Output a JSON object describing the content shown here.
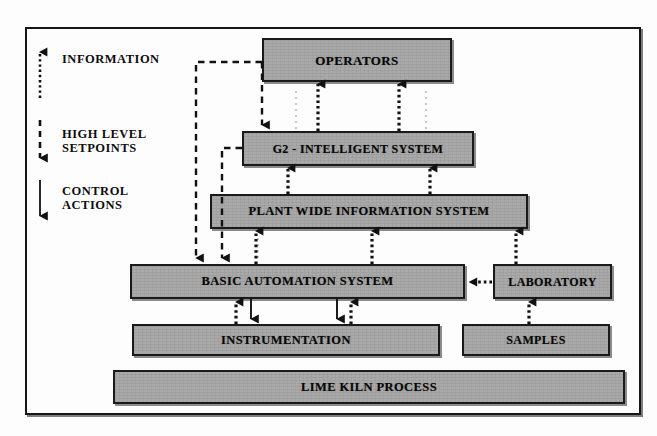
{
  "diagram": {
    "colors": {
      "box_fill": "#a9a9a9",
      "box_border": "#1a1a1a",
      "line": "#111111",
      "background": "#fdfdfd"
    },
    "legend": {
      "items": [
        {
          "label": "INFORMATION",
          "line_style": "dotted",
          "direction": "up"
        },
        {
          "label": "HIGH LEVEL\nSETPOINTS",
          "line_style": "dashed",
          "direction": "down"
        },
        {
          "label": "CONTROL\nACTIONS",
          "line_style": "solid",
          "direction": "down"
        }
      ]
    },
    "nodes": [
      {
        "id": "operators",
        "label": "OPERATORS",
        "x": 262,
        "y": 38,
        "w": 190,
        "h": 44,
        "font_size": 13
      },
      {
        "id": "g2",
        "label": "G2 - INTELLIGENT SYSTEM",
        "x": 242,
        "y": 131,
        "w": 232,
        "h": 35,
        "font_size": 12
      },
      {
        "id": "pwis",
        "label": "PLANT WIDE INFORMATION SYSTEM",
        "x": 210,
        "y": 194,
        "w": 318,
        "h": 35,
        "font_size": 12.5
      },
      {
        "id": "bas",
        "label": "BASIC AUTOMATION SYSTEM",
        "x": 130,
        "y": 264,
        "w": 335,
        "h": 35,
        "font_size": 12.5
      },
      {
        "id": "laboratory",
        "label": "LABORATORY",
        "x": 493,
        "y": 264,
        "w": 119,
        "h": 35,
        "font_size": 12
      },
      {
        "id": "instrumentation",
        "label": "INSTRUMENTATION",
        "x": 132,
        "y": 324,
        "w": 308,
        "h": 32,
        "font_size": 12.5
      },
      {
        "id": "samples",
        "label": "SAMPLES",
        "x": 462,
        "y": 324,
        "w": 148,
        "h": 32,
        "font_size": 12
      },
      {
        "id": "limekiln",
        "label": "LIME KILN PROCESS",
        "x": 113,
        "y": 370,
        "w": 512,
        "h": 34,
        "font_size": 12.5
      }
    ],
    "edges": [
      {
        "id": "g2-to-operators-a",
        "from": "g2",
        "to": "operators",
        "style": "dotted",
        "meaning": "INFORMATION"
      },
      {
        "id": "g2-to-operators-b",
        "from": "g2",
        "to": "operators",
        "style": "dotted",
        "meaning": "INFORMATION"
      },
      {
        "id": "operators-to-g2",
        "from": "operators",
        "to": "g2",
        "style": "dashed",
        "meaning": "HIGH LEVEL SETPOINTS"
      },
      {
        "id": "operators-to-bas",
        "from": "operators",
        "to": "bas",
        "style": "dashed",
        "meaning": "HIGH LEVEL SETPOINTS"
      },
      {
        "id": "g2-to-bas",
        "from": "g2",
        "to": "bas",
        "style": "dashed",
        "meaning": "HIGH LEVEL SETPOINTS"
      },
      {
        "id": "pwis-to-g2-a",
        "from": "pwis",
        "to": "g2",
        "style": "dotted",
        "meaning": "INFORMATION"
      },
      {
        "id": "pwis-to-g2-b",
        "from": "pwis",
        "to": "g2",
        "style": "dotted",
        "meaning": "INFORMATION"
      },
      {
        "id": "bas-to-pwis-a",
        "from": "bas",
        "to": "pwis",
        "style": "dotted",
        "meaning": "INFORMATION"
      },
      {
        "id": "bas-to-pwis-b",
        "from": "bas",
        "to": "pwis",
        "style": "dotted",
        "meaning": "INFORMATION"
      },
      {
        "id": "lab-to-pwis",
        "from": "laboratory",
        "to": "pwis",
        "style": "dotted",
        "meaning": "INFORMATION"
      },
      {
        "id": "lab-to-bas",
        "from": "laboratory",
        "to": "bas",
        "style": "dotted",
        "meaning": "INFORMATION"
      },
      {
        "id": "instr-to-bas-a",
        "from": "instrumentation",
        "to": "bas",
        "style": "dotted",
        "meaning": "INFORMATION"
      },
      {
        "id": "instr-to-bas-b",
        "from": "instrumentation",
        "to": "bas",
        "style": "dotted",
        "meaning": "INFORMATION"
      },
      {
        "id": "bas-to-instr-a",
        "from": "bas",
        "to": "instrumentation",
        "style": "solid",
        "meaning": "CONTROL ACTIONS"
      },
      {
        "id": "bas-to-instr-b",
        "from": "bas",
        "to": "instrumentation",
        "style": "solid",
        "meaning": "CONTROL ACTIONS"
      },
      {
        "id": "samples-to-lab",
        "from": "samples",
        "to": "laboratory",
        "style": "dotted",
        "meaning": "INFORMATION"
      }
    ]
  }
}
